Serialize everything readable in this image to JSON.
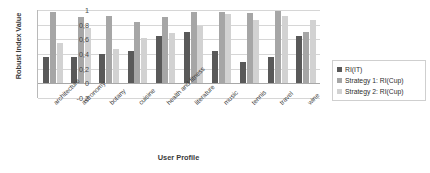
{
  "chart_data": {
    "type": "bar",
    "title": "",
    "xlabel": "User Profile",
    "ylabel": "Robust Index Value",
    "ylim": [
      -0.2,
      1.0
    ],
    "ytick_labels": [
      "1",
      "0,8",
      "0,6",
      "0,4",
      "0,2",
      "0",
      "-0,2"
    ],
    "ytick_values": [
      1.0,
      0.8,
      0.6,
      0.4,
      0.2,
      0.0,
      -0.2
    ],
    "grid": true,
    "legend_position": "right",
    "categories": [
      "architecture",
      "astronomy",
      "botany",
      "cuisine",
      "health and fitness",
      "literature",
      "music",
      "tennis",
      "travel",
      "wine"
    ],
    "series": [
      {
        "name": "RI(IT)",
        "color": "#595959",
        "values": [
          0.36,
          0.36,
          0.4,
          0.44,
          0.64,
          0.7,
          0.44,
          0.29,
          0.36,
          0.64
        ]
      },
      {
        "name": "Strategy 1: RI(Cup)",
        "color": "#a6a6a6",
        "values": [
          0.97,
          0.9,
          0.92,
          0.83,
          0.91,
          0.97,
          0.97,
          0.96,
          0.99,
          0.7
        ]
      },
      {
        "name": "Strategy 2: RI(Cup)",
        "color": "#d2d2d2",
        "values": [
          0.55,
          0.76,
          0.47,
          0.62,
          0.68,
          0.78,
          0.94,
          0.87,
          0.92,
          0.86
        ]
      }
    ]
  },
  "legend": {
    "items": [
      {
        "label": "RI(IT)"
      },
      {
        "label": "Strategy 1: RI(Cup)"
      },
      {
        "label": "Strategy 2: RI(Cup)"
      }
    ]
  }
}
